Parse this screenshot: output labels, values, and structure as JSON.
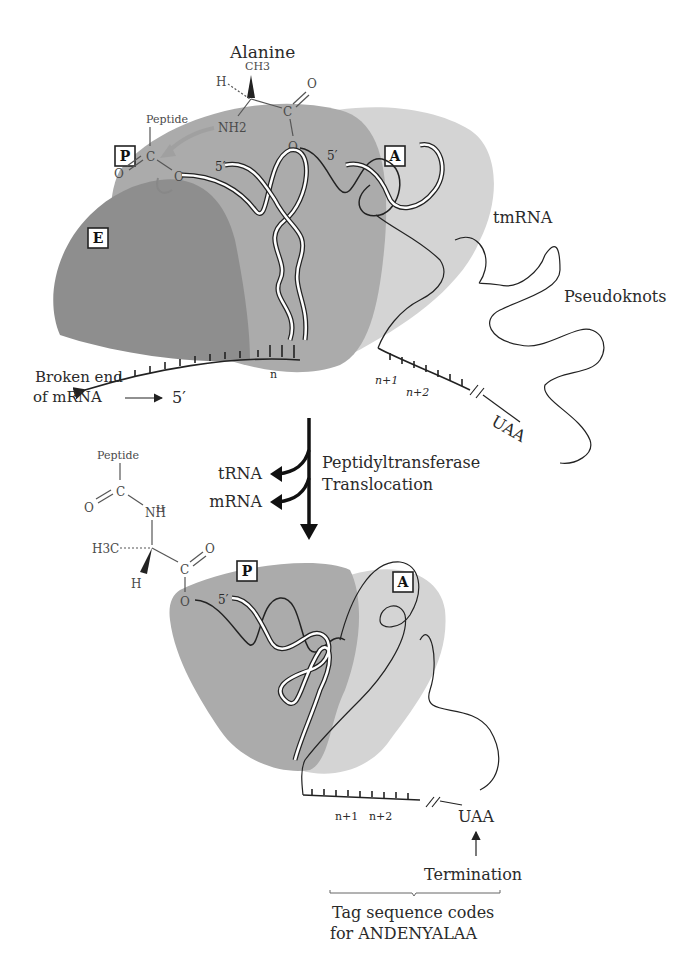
{
  "top_panel": {
    "amino_acid_label": "Alanine",
    "alanine": {
      "methyl": "CH3",
      "hydrogen": "H",
      "carbonyl_o": "O",
      "carbon": "C",
      "ester_o": "O",
      "amine": "NH2"
    },
    "peptide_group": {
      "label": "Peptide",
      "carbon": "C",
      "carbonyl_o": "O",
      "ester_o": "O"
    },
    "sites": {
      "p": "P",
      "a": "A",
      "e": "E"
    },
    "five_prime_p": "5′",
    "five_prime_a": "5′",
    "tmrna_label": "tmRNA",
    "pseudoknots_label": "Pseudoknots",
    "broken_end_line1": "Broken end",
    "broken_end_line2": "of mRNA",
    "mrna_five_prime": "5′",
    "codons": {
      "n": "n",
      "n1": "n+1",
      "n2": "n+2"
    },
    "stop_codon": "UAA"
  },
  "transition": {
    "line1": "Peptidyltransferase",
    "line2": "Translocation",
    "released_1": "tRNA",
    "released_2": "mRNA"
  },
  "bottom_panel": {
    "peptide_group": {
      "label": "Peptide",
      "carbon": "C",
      "carbonyl_o": "O",
      "amine": "NH",
      "amine_h": "H"
    },
    "alanine": {
      "methyl": "H3C",
      "hydrogen": "H",
      "carbon": "C",
      "carbonyl_o": "O",
      "ester_o": "O"
    },
    "sites": {
      "p": "P",
      "a": "A"
    },
    "five_prime": "5′",
    "codons": {
      "n1": "n+1",
      "n2": "n+2"
    },
    "stop_codon": "UAA",
    "termination_label": "Termination",
    "tag_line1": "Tag sequence codes",
    "tag_line2": "for ANDENYALAA"
  },
  "colors": {
    "e_site": "#8c8c8c",
    "p_site": "#a8a8a8",
    "a_site": "#cfcfcf",
    "ink": "#222222",
    "arrow_gray": "#a0a0a0"
  }
}
